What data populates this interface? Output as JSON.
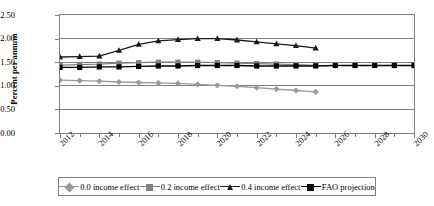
{
  "chart_data": {
    "type": "line",
    "title": "",
    "xlabel": "",
    "ylabel": "Percent per annum",
    "xlim": [
      2012,
      2030
    ],
    "ylim": [
      0.0,
      2.5
    ],
    "yticks": [
      "0.00",
      "0.50",
      "1.00",
      "1.50",
      "2.00",
      "2.50"
    ],
    "ytick_values": [
      0.0,
      0.5,
      1.0,
      1.5,
      2.0,
      2.5
    ],
    "xticks": [
      "2012",
      "2014",
      "2016",
      "2018",
      "2020",
      "2022",
      "2024",
      "2026",
      "2028",
      "2030"
    ],
    "xtick_values": [
      2012,
      2014,
      2016,
      2018,
      2020,
      2022,
      2024,
      2026,
      2028,
      2030
    ],
    "x_minor_values": [
      2013,
      2015,
      2017,
      2019,
      2021,
      2023,
      2025,
      2027,
      2029
    ],
    "grid": "horizontal",
    "legend_position": "bottom",
    "series": [
      {
        "name": "0.0 income effect",
        "color": "#999999",
        "marker": "diamond",
        "x": [
          2012,
          2013,
          2014,
          2015,
          2016,
          2017,
          2018,
          2019,
          2020,
          2021,
          2022,
          2023,
          2024,
          2025
        ],
        "values": [
          1.12,
          1.11,
          1.1,
          1.08,
          1.07,
          1.06,
          1.05,
          1.03,
          1.01,
          0.99,
          0.96,
          0.93,
          0.9,
          0.87
        ]
      },
      {
        "name": "0.2 income effect",
        "color": "#808080",
        "marker": "square",
        "x": [
          2012,
          2013,
          2014,
          2015,
          2016,
          2017,
          2018,
          2019,
          2020,
          2021,
          2022,
          2023,
          2024,
          2025
        ],
        "values": [
          1.44,
          1.45,
          1.46,
          1.48,
          1.49,
          1.5,
          1.5,
          1.5,
          1.49,
          1.48,
          1.47,
          1.46,
          1.45,
          1.43
        ]
      },
      {
        "name": "0.4 income effect",
        "color": "#1a1a1a",
        "marker": "triangle",
        "x": [
          2012,
          2013,
          2014,
          2015,
          2016,
          2017,
          2018,
          2019,
          2020,
          2021,
          2022,
          2023,
          2024,
          2025
        ],
        "values": [
          1.61,
          1.62,
          1.63,
          1.75,
          1.88,
          1.95,
          1.98,
          2.0,
          2.0,
          1.97,
          1.93,
          1.89,
          1.85,
          1.8
        ]
      },
      {
        "name": "FAO projection",
        "color": "#000000",
        "marker": "square",
        "x": [
          2012,
          2013,
          2014,
          2015,
          2016,
          2017,
          2018,
          2019,
          2020,
          2021,
          2022,
          2023,
          2024,
          2025,
          2026,
          2027,
          2028,
          2029,
          2030
        ],
        "values": [
          1.39,
          1.39,
          1.4,
          1.4,
          1.41,
          1.42,
          1.42,
          1.43,
          1.43,
          1.43,
          1.42,
          1.42,
          1.42,
          1.42,
          1.43,
          1.43,
          1.43,
          1.43,
          1.43
        ]
      }
    ]
  },
  "legend": {
    "items": [
      {
        "label": "0.0 income effect"
      },
      {
        "label": "0.2 income effect"
      },
      {
        "label": "0.4 income effect"
      },
      {
        "label": "FAO projection"
      }
    ]
  },
  "axis": {
    "y_title": "Percent per annum"
  },
  "colors": {
    "axis": "#808080",
    "grid": "#808080",
    "series_00": "#999999",
    "series_02": "#808080",
    "series_04": "#1a1a1a",
    "series_fao": "#000000"
  }
}
